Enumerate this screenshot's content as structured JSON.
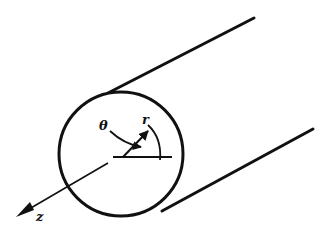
{
  "diagram": {
    "labels": {
      "theta": "θ",
      "r": "r",
      "z": "z"
    },
    "colors": {
      "stroke": "#111111",
      "background": "#ffffff"
    },
    "circle": {
      "cx": 121,
      "cy": 154,
      "r": 62
    },
    "tangent_lines": [
      {
        "x1": 108,
        "y1": 93,
        "x2": 254,
        "y2": 18
      },
      {
        "x1": 160,
        "y1": 212,
        "x2": 313,
        "y2": 129
      }
    ]
  }
}
